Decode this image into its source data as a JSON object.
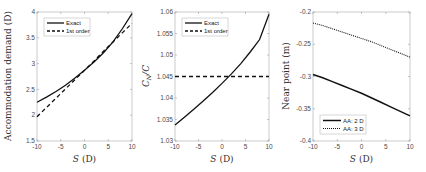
{
  "chart_data": [
    {
      "type": "line",
      "title": "",
      "xlabel": "S (D)",
      "ylabel": "Accommodation demand (D)",
      "xlim": [
        -10,
        10
      ],
      "ylim": [
        1.5,
        4
      ],
      "xticks": [
        "-10",
        "-5",
        "0",
        "5",
        "10"
      ],
      "yticks": [
        "1.5",
        "2",
        "2.5",
        "3",
        "3.5",
        "4"
      ],
      "grid": false,
      "legend_position": "upper left",
      "x": [
        -10,
        -8,
        -6,
        -4,
        -2,
        0,
        2,
        4,
        6,
        8,
        10
      ],
      "series": [
        {
          "name": "Exact",
          "style": "solid",
          "values": [
            2.25,
            2.35,
            2.46,
            2.58,
            2.72,
            2.87,
            3.03,
            3.21,
            3.42,
            3.68,
            3.97
          ]
        },
        {
          "name": "1st order",
          "style": "dashed",
          "values": [
            1.97,
            2.15,
            2.33,
            2.51,
            2.69,
            2.87,
            3.05,
            3.24,
            3.42,
            3.6,
            3.78
          ]
        }
      ]
    },
    {
      "type": "line",
      "title": "",
      "xlabel": "S (D)",
      "ylabel": "C_N / C",
      "xlim": [
        -10,
        10
      ],
      "ylim": [
        1.03,
        1.06
      ],
      "xticks": [
        "-10",
        "-5",
        "0",
        "5",
        "10"
      ],
      "yticks": [
        "1.03",
        "1.035",
        "1.04",
        "1.045",
        "1.05",
        "1.055",
        "1.06"
      ],
      "grid": false,
      "legend_position": "upper left",
      "x": [
        -10,
        -8,
        -6,
        -4,
        -2,
        0,
        2,
        4,
        6,
        8,
        10
      ],
      "series": [
        {
          "name": "Exact",
          "style": "solid",
          "values": [
            1.0337,
            1.0355,
            1.0374,
            1.0393,
            1.0413,
            1.0434,
            1.0456,
            1.048,
            1.0507,
            1.0536,
            1.0595
          ]
        },
        {
          "name": "1st order",
          "style": "dashed",
          "values": [
            1.045,
            1.045,
            1.045,
            1.045,
            1.045,
            1.045,
            1.045,
            1.045,
            1.045,
            1.045,
            1.045
          ]
        }
      ]
    },
    {
      "type": "line",
      "title": "",
      "xlabel": "S (D)",
      "ylabel": "Near point (m)",
      "xlim": [
        -10,
        10
      ],
      "ylim": [
        -0.4,
        -0.2
      ],
      "xticks": [
        "-10",
        "-5",
        "0",
        "5",
        "10"
      ],
      "yticks": [
        "-0.4",
        "-0.35",
        "-0.3",
        "-0.25",
        "-0.2"
      ],
      "grid": false,
      "legend_position": "lower left",
      "x": [
        -10,
        -8,
        -6,
        -4,
        -2,
        0,
        2,
        4,
        6,
        8,
        10
      ],
      "series": [
        {
          "name": "AA: 2 D",
          "style": "solid",
          "values": [
            -0.297,
            -0.302,
            -0.308,
            -0.314,
            -0.32,
            -0.326,
            -0.333,
            -0.34,
            -0.347,
            -0.354,
            -0.361
          ]
        },
        {
          "name": "AA: 3 D",
          "style": "dotted",
          "values": [
            -0.217,
            -0.221,
            -0.226,
            -0.231,
            -0.236,
            -0.241,
            -0.246,
            -0.252,
            -0.258,
            -0.264,
            -0.27
          ]
        }
      ]
    }
  ],
  "labels": {
    "p1_xlabel_var": "S",
    "p1_xlabel_unit": " (D)",
    "p1_ylabel": "Accommodation demand (D)",
    "p2_xlabel_var": "S",
    "p2_xlabel_unit": " (D)",
    "p2_ylabel_main": "C",
    "p2_ylabel_sub": "N",
    "p2_ylabel_rest": "/C",
    "p3_xlabel_var": "S",
    "p3_xlabel_unit": " (D)",
    "p3_ylabel": "Near point (m)",
    "legend_exact": "Exact",
    "legend_first": "1st order",
    "legend_aa2": "AA: 2 D",
    "legend_aa3": "AA: 3 D"
  }
}
